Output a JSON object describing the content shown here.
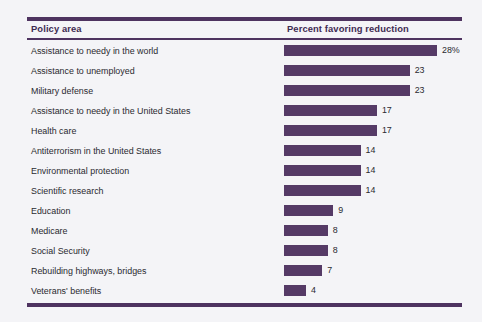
{
  "table": {
    "columns": [
      "Policy area",
      "Percent favoring reduction"
    ]
  },
  "colors": {
    "bar": "#553a66",
    "rule": "#4e3360",
    "header_text": "#3f2b52",
    "body_text": "#2a2a30",
    "background": "#f4f4f7"
  },
  "chart_data": {
    "type": "bar",
    "title": "",
    "xlabel": "Percent favoring reduction",
    "ylabel": "Policy area",
    "orientation": "horizontal",
    "grid": false,
    "legend": null,
    "xlim": [
      0,
      28
    ],
    "value_unit": "percent",
    "categories": [
      "Assistance to needy in the world",
      "Assistance to unemployed",
      "Military defense",
      "Assistance to needy in the United States",
      "Health care",
      "Antiterrorism in the United States",
      "Environmental protection",
      "Scientific research",
      "Education",
      "Medicare",
      "Social Security",
      "Rebuilding highways, bridges",
      "Veterans' benefits"
    ],
    "values": [
      28,
      23,
      23,
      17,
      17,
      14,
      14,
      14,
      9,
      8,
      8,
      7,
      4
    ],
    "value_labels": [
      "28%",
      "23",
      "23",
      "17",
      "17",
      "14",
      "14",
      "14",
      "9",
      "8",
      "8",
      "7",
      "4"
    ]
  }
}
